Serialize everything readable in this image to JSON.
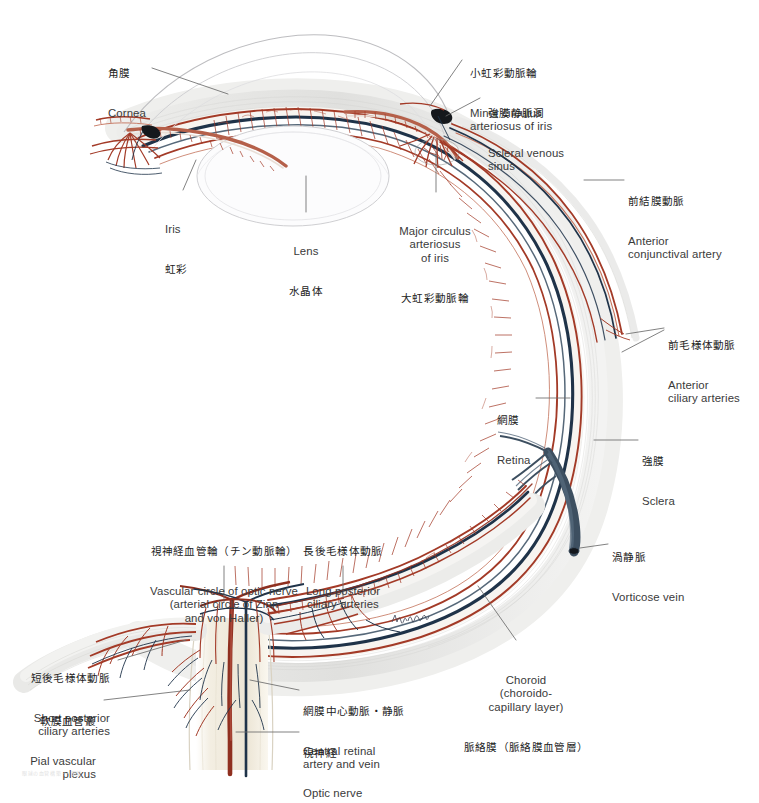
{
  "plate": {
    "title": "Arteries and veins of the eye — sagittal section",
    "signature": "T. Yoshida",
    "footer_mark": "眼球の血管構築 — 図版"
  },
  "palette": {
    "artery": "#a33a27",
    "artery_light": "#c4735c",
    "vein": "#1f3349",
    "vein_light": "#4a637a",
    "sclera": "#e3e3e1",
    "sclera_edge": "#c9c9c6",
    "choroid_fill": "#f6f2ee",
    "optic_nerve": "#f1ece0",
    "optic_nerve_edge": "#d9d2c2",
    "cornea_line": "#b9b9bb",
    "lens_line": "#cfcfd2",
    "leader": "#6b6b6b",
    "text": "#333333",
    "vorticose": "#3d4f60"
  },
  "labels": [
    {
      "id": "cornea",
      "name": "label-cornea",
      "ja": "角膜",
      "en": "Cornea",
      "align": "left",
      "x": 108,
      "y": 40
    },
    {
      "id": "minor-circulus",
      "name": "label-minor-circulus-arteriosus-of-iris",
      "ja": "小虹彩動脈輪",
      "en": "Minor circulus\narteriosus of iris",
      "align": "left",
      "x": 470,
      "y": 40
    },
    {
      "id": "scleral-venous-sinus",
      "name": "label-scleral-venous-sinus",
      "ja": "強膜静脈洞",
      "en": "Scleral venous\nsinus",
      "align": "left",
      "x": 488,
      "y": 80
    },
    {
      "id": "iris",
      "name": "label-iris",
      "ja": "虹彩",
      "en": "Iris",
      "align": "left",
      "x": 165,
      "y": 196,
      "order": "en-first"
    },
    {
      "id": "lens",
      "name": "label-lens",
      "ja": "水晶体",
      "en": "Lens",
      "align": "center",
      "x": 306,
      "y": 218,
      "order": "en-first"
    },
    {
      "id": "major-circulus",
      "name": "label-major-circulus-arteriosus-of-iris",
      "ja": "大虹彩動脈輪",
      "en": "Major circulus\narteriosus\nof iris",
      "align": "center",
      "x": 434,
      "y": 198,
      "order": "en-first"
    },
    {
      "id": "anterior-conjunctival-artery",
      "name": "label-anterior-conjunctival-artery",
      "ja": "前結膜動脈",
      "en": "Anterior\nconjunctival artery",
      "align": "left",
      "x": 628,
      "y": 168
    },
    {
      "id": "anterior-ciliary-arteries",
      "name": "label-anterior-ciliary-arteries",
      "ja": "前毛様体動脈",
      "en": "Anterior\nciliary arteries",
      "align": "left",
      "x": 668,
      "y": 312
    },
    {
      "id": "retina",
      "name": "label-retina",
      "ja": "網膜",
      "en": "Retina",
      "align": "left",
      "x": 497,
      "y": 387
    },
    {
      "id": "sclera",
      "name": "label-sclera",
      "ja": "強膜",
      "en": "Sclera",
      "align": "left",
      "x": 642,
      "y": 428
    },
    {
      "id": "vorticose-vein",
      "name": "label-vorticose-vein",
      "ja": "渦静脈",
      "en": "Vorticose vein",
      "align": "left",
      "x": 612,
      "y": 524
    },
    {
      "id": "vascular-circle-optic-nerve",
      "name": "label-vascular-circle-of-optic-nerve",
      "ja": "視神経血管輪（チン動脈輪）",
      "en": "Vascular circle of optic nerve\n(arterial circle of Zinn\nand von Haller)",
      "align": "center",
      "x": 224,
      "y": 518
    },
    {
      "id": "long-posterior-ciliary",
      "name": "label-long-posterior-ciliary-arteries",
      "ja": "長後毛様体動脈",
      "en": "Long posterior\nciliary arteries",
      "align": "center",
      "x": 343,
      "y": 518
    },
    {
      "id": "short-posterior-ciliary",
      "name": "label-short-posterior-ciliary-arteries",
      "ja": "短後毛様体動脈",
      "en": "Short posterior\nciliary arteries",
      "align": "right",
      "x": 110,
      "y": 645
    },
    {
      "id": "pial-vascular-plexus",
      "name": "label-pial-vascular-plexus",
      "ja": "軟膜血管叢",
      "en": "Pial vascular\nplexus",
      "align": "right",
      "x": 96,
      "y": 688
    },
    {
      "id": "central-retinal",
      "name": "label-central-retinal-artery-and-vein",
      "ja": "網膜中心動脈・静脈",
      "en": "Central retinal\nartery and vein",
      "align": "left",
      "x": 303,
      "y": 678
    },
    {
      "id": "optic-nerve",
      "name": "label-optic-nerve",
      "ja": "視神経",
      "en": "Optic nerve",
      "align": "left",
      "x": 303,
      "y": 720
    },
    {
      "id": "choroid",
      "name": "label-choroid",
      "ja": "脈絡膜（脈絡膜血管層）",
      "en": "Choroid\n(choroido-\ncapillary layer)",
      "align": "center",
      "x": 526,
      "y": 647,
      "order": "en-first"
    }
  ]
}
